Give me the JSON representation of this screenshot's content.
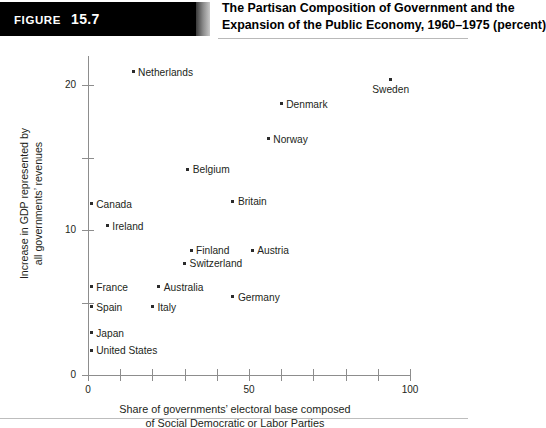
{
  "figure": {
    "tag_word": "Figure",
    "tag_number": "15.7",
    "title_line_1": "The Partisan Composition of Government and the",
    "title_line_2": "Expansion of the Public Economy, 1960–1975 (percent)"
  },
  "axes": {
    "y_title_line_1": "Increase in GDP represented by",
    "y_title_line_2": "all governments’ revenues",
    "x_title_line_1": "Share of governments’ electoral base composed",
    "x_title_line_2": "of Social Democratic or Labor Parties",
    "y_ticks": [
      "0",
      "10",
      "20"
    ],
    "x_ticks": [
      "0",
      "50",
      "100"
    ]
  },
  "colors": {
    "tag_background": "#000000",
    "tag_text": "#ffffff",
    "axis": "#8d8d8d",
    "point": "#2b2b2b",
    "text": "#231f20"
  },
  "chart_data": {
    "type": "scatter",
    "title": "The Partisan Composition of Government and the Expansion of the Public Economy, 1960–1975 (percent)",
    "xlabel": "Share of governments’ electoral base composed of Social Democratic or Labor Parties",
    "ylabel": "Increase in GDP represented by all governments’ revenues",
    "xlim": [
      0,
      100
    ],
    "ylim": [
      0,
      22
    ],
    "xticks": [
      0,
      10,
      20,
      30,
      40,
      50,
      60,
      70,
      80,
      90,
      100
    ],
    "xticklabels": [
      "0",
      "",
      "",
      "",
      "",
      "50",
      "",
      "",
      "",
      "",
      "100"
    ],
    "yticks": [
      0,
      5,
      10,
      15,
      20
    ],
    "yticklabels": [
      "0",
      "",
      "10",
      "",
      "20"
    ],
    "grid": false,
    "legend": "none",
    "points": [
      {
        "label": "Netherlands",
        "x": 14,
        "y": 20.9,
        "label_pos": "right"
      },
      {
        "label": "Sweden",
        "x": 94,
        "y": 20.4,
        "label_pos": "below"
      },
      {
        "label": "Denmark",
        "x": 60,
        "y": 18.7,
        "label_pos": "right"
      },
      {
        "label": "Norway",
        "x": 56,
        "y": 16.3,
        "label_pos": "right"
      },
      {
        "label": "Belgium",
        "x": 31,
        "y": 14.2,
        "label_pos": "right"
      },
      {
        "label": "Britain",
        "x": 45,
        "y": 12.0,
        "label_pos": "right"
      },
      {
        "label": "Canada",
        "x": 1,
        "y": 11.8,
        "label_pos": "right"
      },
      {
        "label": "Ireland",
        "x": 6,
        "y": 10.3,
        "label_pos": "right"
      },
      {
        "label": "Finland",
        "x": 32,
        "y": 8.6,
        "label_pos": "right"
      },
      {
        "label": "Austria",
        "x": 51,
        "y": 8.6,
        "label_pos": "right"
      },
      {
        "label": "Switzerland",
        "x": 30,
        "y": 7.7,
        "label_pos": "right"
      },
      {
        "label": "France",
        "x": 1,
        "y": 6.1,
        "label_pos": "right"
      },
      {
        "label": "Australia",
        "x": 22,
        "y": 6.1,
        "label_pos": "right"
      },
      {
        "label": "Germany",
        "x": 45,
        "y": 5.4,
        "label_pos": "right"
      },
      {
        "label": "Spain",
        "x": 1,
        "y": 4.7,
        "label_pos": "right"
      },
      {
        "label": "Italy",
        "x": 20,
        "y": 4.7,
        "label_pos": "right"
      },
      {
        "label": "Japan",
        "x": 1,
        "y": 2.9,
        "label_pos": "right"
      },
      {
        "label": "United States",
        "x": 1,
        "y": 1.7,
        "label_pos": "right"
      }
    ]
  }
}
